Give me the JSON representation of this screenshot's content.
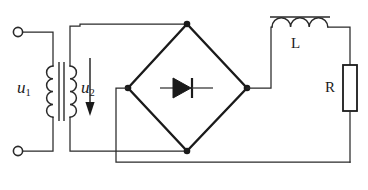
{
  "figure": {
    "background_color": "#ffffff",
    "line_color": "#2a2a2a",
    "width": 368,
    "height": 190
  },
  "labels": {
    "u1": "u",
    "u1_sub": "1",
    "u2": "u",
    "u2_sub": "2",
    "inductor": "L",
    "resistor": "R"
  },
  "components": [
    {
      "name": "input-terminal-top",
      "type": "terminal",
      "label": "",
      "x": 18,
      "y": 32
    },
    {
      "name": "input-terminal-bottom",
      "type": "terminal",
      "label": "",
      "x": 18,
      "y": 151
    },
    {
      "name": "transformer",
      "type": "transformer",
      "primary_label": "u1",
      "secondary_label": "u2",
      "primary_turns": 4,
      "secondary_turns": 4
    },
    {
      "name": "voltage-arrow-u2",
      "type": "arrow",
      "direction": "down",
      "label": "u2"
    },
    {
      "name": "bridge-rectifier",
      "type": "diode-bridge",
      "shape": "diamond",
      "inner_symbol": "diode",
      "diode_direction": "right"
    },
    {
      "name": "inductor",
      "type": "inductor",
      "label": "L",
      "coils": 3,
      "has_core_bar": true
    },
    {
      "name": "load-resistor",
      "type": "resistor",
      "label": "R",
      "orientation": "vertical"
    }
  ],
  "nodes": [
    {
      "name": "bridge-node-top",
      "x": 187,
      "y": 24
    },
    {
      "name": "bridge-node-left",
      "x": 128,
      "y": 88
    },
    {
      "name": "bridge-node-right",
      "x": 247,
      "y": 88
    },
    {
      "name": "bridge-node-bottom",
      "x": 187,
      "y": 151
    }
  ]
}
